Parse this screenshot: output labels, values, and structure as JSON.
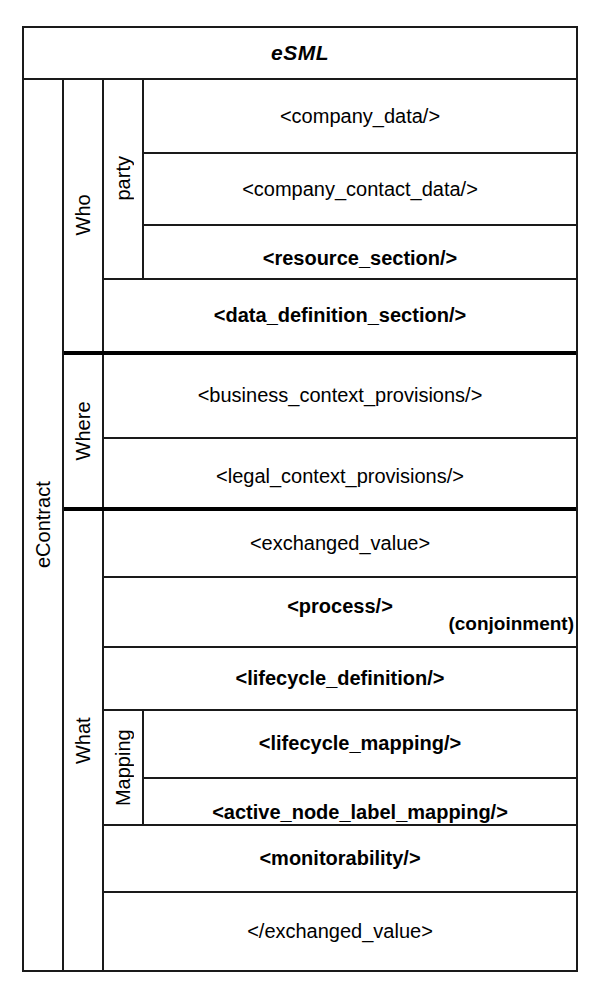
{
  "header": {
    "title": "eSML"
  },
  "root": {
    "label": "eContract"
  },
  "sections": [
    {
      "label": "Who",
      "subgroup": {
        "label": "party",
        "rows": [
          {
            "text": "<company_data/>",
            "bold": false
          },
          {
            "text": "<company_contact_data/>",
            "bold": false
          },
          {
            "text": "<resource_section/>",
            "bold": true
          }
        ]
      },
      "rows": [
        {
          "text": "<data_definition_section/>",
          "bold": true
        }
      ]
    },
    {
      "label": "Where",
      "rows": [
        {
          "text": "<business_context_provisions/>",
          "bold": false
        },
        {
          "text": "<legal_context_provisions/>",
          "bold": false
        }
      ]
    },
    {
      "label": "What",
      "rows_before": [
        {
          "text": "<exchanged_value>",
          "bold": false
        },
        {
          "text": "<process/>",
          "note": "(conjoinment)",
          "bold": true
        },
        {
          "text": "<lifecycle_definition/>",
          "bold": true
        }
      ],
      "subgroup": {
        "label": "Mapping",
        "rows": [
          {
            "text": "<lifecycle_mapping/>",
            "bold": true
          },
          {
            "text": "<active_node_label_mapping/>",
            "bold": true
          }
        ]
      },
      "rows_after": [
        {
          "text": "<monitorability/>",
          "bold": true
        },
        {
          "text": "</exchanged_value>",
          "bold": false
        }
      ]
    }
  ],
  "colors": {
    "line": "#1a1a1a",
    "thick_divider": "#000000",
    "background": "#ffffff",
    "text": "#000000"
  }
}
